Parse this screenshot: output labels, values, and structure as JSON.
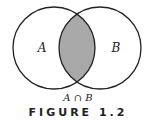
{
  "diagram": {
    "type": "venn",
    "sets": [
      {
        "label": "A",
        "cx": 54,
        "cy": 48,
        "r": 41
      },
      {
        "label": "B",
        "cx": 100,
        "cy": 48,
        "r": 41
      }
    ],
    "shaded_region": "intersection",
    "shade_color": "#a9a9a9",
    "stroke_color": "#222222"
  },
  "caption": "A ∩ B",
  "figure_title": "FIGURE 1.2"
}
